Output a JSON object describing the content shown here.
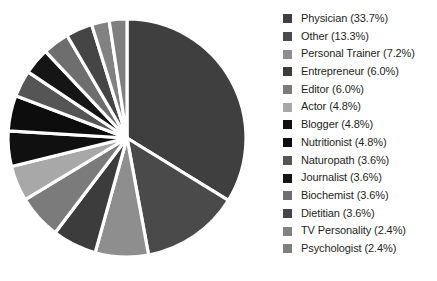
{
  "chart_data": {
    "type": "pie",
    "title": "",
    "subtitle": "",
    "xlabel": "",
    "ylabel": "",
    "legend_position": "right",
    "grid": false,
    "start_angle_deg": 0,
    "direction": "clockwise",
    "separator_color": "#ffffff",
    "background_color": "#ffffff",
    "labels": [
      "Physician",
      "Other",
      "Personal Trainer",
      "Entrepreneur",
      "Editor",
      "Actor",
      "Blogger",
      "Nutritionist",
      "Naturopath",
      "Journalist",
      "Biochemist",
      "Dietitian",
      "TV Personality",
      "Psychologist"
    ],
    "values": [
      33.7,
      13.3,
      7.2,
      6.0,
      6.0,
      4.8,
      4.8,
      4.8,
      3.6,
      3.6,
      3.6,
      3.6,
      2.4,
      2.4
    ],
    "value_suffix": "%",
    "colors": [
      "#3f3f3f",
      "#4a4a4a",
      "#8e8e8e",
      "#3c3c3c",
      "#7b7b7b",
      "#a8a8a8",
      "#101010",
      "#0d0d0d",
      "#555555",
      "#151515",
      "#6e6e6e",
      "#454545",
      "#828282",
      "#7f7f7f"
    ]
  },
  "legend": {
    "entries": [
      {
        "label": "Physician (33.7%)",
        "color": "#3f3f3f"
      },
      {
        "label": "Other (13.3%)",
        "color": "#4a4a4a"
      },
      {
        "label": "Personal Trainer (7.2%)",
        "color": "#8e8e8e"
      },
      {
        "label": "Entrepreneur (6.0%)",
        "color": "#3c3c3c"
      },
      {
        "label": "Editor (6.0%)",
        "color": "#7b7b7b"
      },
      {
        "label": "Actor (4.8%)",
        "color": "#a8a8a8"
      },
      {
        "label": "Blogger (4.8%)",
        "color": "#101010"
      },
      {
        "label": "Nutritionist (4.8%)",
        "color": "#0d0d0d"
      },
      {
        "label": "Naturopath (3.6%)",
        "color": "#555555"
      },
      {
        "label": "Journalist (3.6%)",
        "color": "#151515"
      },
      {
        "label": "Biochemist (3.6%)",
        "color": "#6e6e6e"
      },
      {
        "label": "Dietitian (3.6%)",
        "color": "#454545"
      },
      {
        "label": "TV Personality (2.4%)",
        "color": "#828282"
      },
      {
        "label": "Psychologist (2.4%)",
        "color": "#7f7f7f"
      }
    ]
  },
  "pie_geometry": {
    "center_x": 127,
    "center_y": 138,
    "radius": 119
  }
}
